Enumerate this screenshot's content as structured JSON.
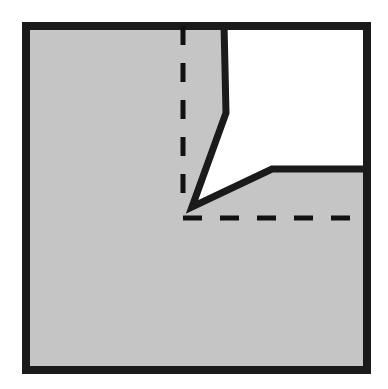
{
  "figure": {
    "canvas": {
      "width": 388,
      "height": 389,
      "background": "#ffffff"
    },
    "colors": {
      "fill_gray": "#c5c5c5",
      "fill_white": "#ffffff",
      "stroke_black": "#1a1a1a",
      "dashed_black": "#111111"
    },
    "strokes": {
      "border_width": 8,
      "edge_width": 7,
      "dash_width": 5,
      "dash_pattern": "19 18"
    },
    "shapes": {
      "outer_square": {
        "name": "outer-square",
        "x": 26,
        "y": 26,
        "width": 341,
        "height": 344
      },
      "gray_region_points": "26,26 224,26 226,113 192,207 272,169 367,169 367,370 26,370",
      "white_notch_points": "226,26 367,26 367,169 272,169 192,207 228,113",
      "notch_left_edge": {
        "from_x": 224,
        "from_y": 26,
        "bend_x": 226,
        "bend_y": 113,
        "to_x": 192,
        "to_y": 207
      },
      "notch_lower_edge": {
        "from_x": 192,
        "from_y": 207,
        "corner_x": 272,
        "corner_y": 169,
        "to_x": 367,
        "to_y": 169
      },
      "dashed_vertical": {
        "x": 183,
        "y1": 26,
        "y2": 209
      },
      "dashed_horizontal": {
        "y": 218,
        "x1": 183,
        "x2": 367
      }
    },
    "labels": {
      "figure_caption": "",
      "annotations": []
    }
  },
  "chart_data": {
    "type": "diagram",
    "elements": [
      {
        "name": "outer-square-border",
        "kind": "rectangle",
        "stroke": "#1a1a1a",
        "fill": "#c5c5c5",
        "bounds": [
          26,
          26,
          367,
          370
        ]
      },
      {
        "name": "white-notch",
        "kind": "polygon",
        "fill": "#ffffff",
        "vertices": [
          [
            226,
            26
          ],
          [
            367,
            26
          ],
          [
            367,
            169
          ],
          [
            272,
            169
          ],
          [
            192,
            207
          ],
          [
            228,
            113
          ]
        ]
      },
      {
        "name": "notch-solid-outline",
        "kind": "polyline",
        "stroke": "#1a1a1a",
        "vertices": [
          [
            224,
            26
          ],
          [
            226,
            113
          ],
          [
            192,
            207
          ],
          [
            272,
            169
          ],
          [
            367,
            169
          ]
        ]
      },
      {
        "name": "dashed-vertical-construction-line",
        "kind": "line",
        "stroke": "#111111",
        "dashed": true,
        "from": [
          183,
          26
        ],
        "to": [
          183,
          209
        ]
      },
      {
        "name": "dashed-horizontal-construction-line",
        "kind": "line",
        "stroke": "#111111",
        "dashed": true,
        "from": [
          183,
          218
        ],
        "to": [
          367,
          218
        ]
      }
    ]
  }
}
